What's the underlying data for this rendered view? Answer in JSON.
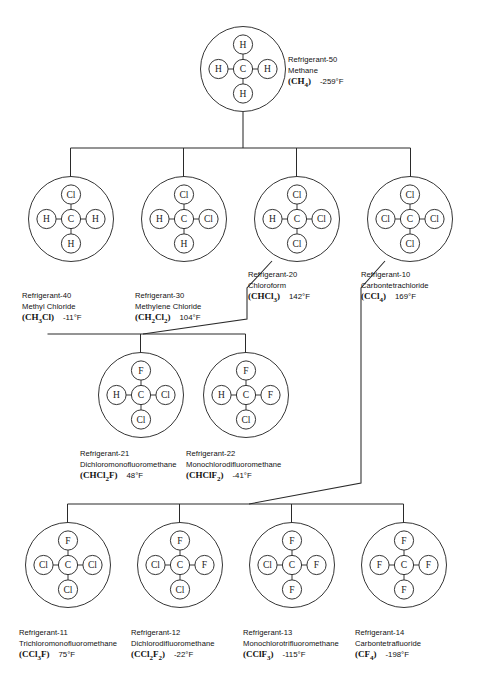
{
  "chart_data": {
    "type": "diagram",
    "xlabel": "",
    "ylabel": "",
    "layout": "hierarchical tree, 4 levels, parent node Methane at top",
    "nodes": [
      {
        "id": "r50",
        "refrigerant": "Refrigerant-50",
        "name": "Methane",
        "formula": "CH4",
        "formula_parts": [
          {
            "t": "(CH",
            "sub": false
          },
          {
            "t": "4",
            "sub": true
          },
          {
            "t": ")",
            "sub": false
          }
        ],
        "boiling_point": "-259°F",
        "bp_value": -259,
        "center_atom": "C",
        "top": "H",
        "left": "H",
        "right": "H",
        "bottom": "H",
        "x": 200,
        "y": 26,
        "level": 1
      },
      {
        "id": "r40",
        "refrigerant": "Refrigerant-40",
        "name": "Methyl Chloride",
        "formula": "CH3Cl",
        "formula_parts": [
          {
            "t": "(CH",
            "sub": false
          },
          {
            "t": "3",
            "sub": true
          },
          {
            "t": "Cl)",
            "sub": false
          }
        ],
        "boiling_point": "-11°F",
        "bp_value": -11,
        "center_atom": "C",
        "top": "Cl",
        "left": "H",
        "right": "H",
        "bottom": "H",
        "x": 28,
        "y": 176,
        "level": 2
      },
      {
        "id": "r30",
        "refrigerant": "Refrigerant-30",
        "name": "Methylene Chloride",
        "formula": "CH2Cl2",
        "formula_parts": [
          {
            "t": "(CH",
            "sub": false
          },
          {
            "t": "2",
            "sub": true
          },
          {
            "t": "Cl",
            "sub": false
          },
          {
            "t": "2",
            "sub": true
          },
          {
            "t": ")",
            "sub": false
          }
        ],
        "boiling_point": "104°F",
        "bp_value": 104,
        "center_atom": "C",
        "top": "Cl",
        "left": "H",
        "right": "Cl",
        "bottom": "H",
        "x": 141,
        "y": 176,
        "level": 2
      },
      {
        "id": "r20",
        "refrigerant": "Refrigerant-20",
        "name": "Chloroform",
        "formula": "CHCl3",
        "formula_parts": [
          {
            "t": "(CHCl",
            "sub": false
          },
          {
            "t": "3",
            "sub": true
          },
          {
            "t": ")",
            "sub": false
          }
        ],
        "boiling_point": "142°F",
        "bp_value": 142,
        "center_atom": "C",
        "top": "Cl",
        "left": "H",
        "right": "Cl",
        "bottom": "Cl",
        "x": 254,
        "y": 176,
        "level": 2
      },
      {
        "id": "r10",
        "refrigerant": "Refrigerant-10",
        "name": "Carbontetrachloride",
        "formula": "CCl4",
        "formula_parts": [
          {
            "t": "(CCl",
            "sub": false
          },
          {
            "t": "4",
            "sub": true
          },
          {
            "t": ")",
            "sub": false
          }
        ],
        "boiling_point": "169°F",
        "bp_value": 169,
        "center_atom": "C",
        "top": "Cl",
        "left": "Cl",
        "right": "Cl",
        "bottom": "Cl",
        "x": 367,
        "y": 176,
        "level": 2
      },
      {
        "id": "r21",
        "refrigerant": "Refrigerant-21",
        "name": "Dichloromonofluoromethane",
        "formula": "CHCl2F",
        "formula_parts": [
          {
            "t": "(CHCl",
            "sub": false
          },
          {
            "t": "2",
            "sub": true
          },
          {
            "t": "F)",
            "sub": false
          }
        ],
        "boiling_point": "48°F",
        "bp_value": 48,
        "center_atom": "C",
        "top": "F",
        "left": "H",
        "right": "Cl",
        "bottom": "Cl",
        "x": 98,
        "y": 352,
        "level": 3
      },
      {
        "id": "r22",
        "refrigerant": "Refrigerant-22",
        "name": "Monochlorodifluoromethane",
        "formula": "CHClF2",
        "formula_parts": [
          {
            "t": "(CHClF",
            "sub": false
          },
          {
            "t": "2",
            "sub": true
          },
          {
            "t": ")",
            "sub": false
          }
        ],
        "boiling_point": "-41°F",
        "bp_value": -41,
        "center_atom": "C",
        "top": "F",
        "left": "H",
        "right": "F",
        "bottom": "Cl",
        "x": 203,
        "y": 352,
        "level": 3
      },
      {
        "id": "r11",
        "refrigerant": "Refrigerant-11",
        "name": "Trichloromonofluoromethane",
        "formula": "CCl3F",
        "formula_parts": [
          {
            "t": "(CCl",
            "sub": false
          },
          {
            "t": "3",
            "sub": true
          },
          {
            "t": "F)",
            "sub": false
          }
        ],
        "boiling_point": "75°F",
        "bp_value": 75,
        "center_atom": "C",
        "top": "F",
        "left": "Cl",
        "right": "Cl",
        "bottom": "Cl",
        "x": 25,
        "y": 522,
        "level": 4
      },
      {
        "id": "r12",
        "refrigerant": "Refrigerant-12",
        "name": "Dichlorodifluoromethane",
        "formula": "CCl2F2",
        "formula_parts": [
          {
            "t": "(CCl",
            "sub": false
          },
          {
            "t": "2",
            "sub": true
          },
          {
            "t": "F",
            "sub": false
          },
          {
            "t": "2",
            "sub": true
          },
          {
            "t": ")",
            "sub": false
          }
        ],
        "boiling_point": "-22°F",
        "bp_value": -22,
        "center_atom": "C",
        "top": "F",
        "left": "Cl",
        "right": "F",
        "bottom": "Cl",
        "x": 137,
        "y": 522,
        "level": 4
      },
      {
        "id": "r13",
        "refrigerant": "Refrigerant-13",
        "name": "Monochlorotrifluoromethane",
        "formula": "CClF3",
        "formula_parts": [
          {
            "t": "(CClF",
            "sub": false
          },
          {
            "t": "3",
            "sub": true
          },
          {
            "t": ")",
            "sub": false
          }
        ],
        "boiling_point": "-115°F",
        "bp_value": -115,
        "center_atom": "C",
        "top": "F",
        "left": "Cl",
        "right": "F",
        "bottom": "F",
        "x": 249,
        "y": 522,
        "level": 4
      },
      {
        "id": "r14",
        "refrigerant": "Refrigerant-14",
        "name": "Carbontetrafluoride",
        "formula": "CF4",
        "formula_parts": [
          {
            "t": "(CF",
            "sub": false
          },
          {
            "t": "4",
            "sub": true
          },
          {
            "t": ")",
            "sub": false
          }
        ],
        "boiling_point": "-198°F",
        "bp_value": -198,
        "center_atom": "C",
        "top": "F",
        "left": "F",
        "right": "F",
        "bottom": "F",
        "x": 361,
        "y": 522,
        "level": 4
      }
    ],
    "edges": [
      {
        "from": "r50",
        "to": "r40"
      },
      {
        "from": "r50",
        "to": "r30"
      },
      {
        "from": "r50",
        "to": "r20"
      },
      {
        "from": "r50",
        "to": "r10"
      },
      {
        "from": "r20",
        "to": "r21"
      },
      {
        "from": "r20",
        "to": "r22"
      },
      {
        "from": "r10",
        "to": "r11"
      },
      {
        "from": "r10",
        "to": "r12"
      },
      {
        "from": "r10",
        "to": "r13"
      },
      {
        "from": "r10",
        "to": "r14"
      }
    ],
    "line_color": "#2a2a2a",
    "background": "#ffffff"
  },
  "captions": {
    "r50": {
      "x": 288,
      "y": 55
    },
    "r40": {
      "x": 22,
      "y": 291
    },
    "r30": {
      "x": 135,
      "y": 291
    },
    "r20": {
      "x": 248,
      "y": 270
    },
    "r10": {
      "x": 361,
      "y": 270
    },
    "r21": {
      "x": 80,
      "y": 449
    },
    "r22": {
      "x": 186,
      "y": 449
    },
    "r11": {
      "x": 19,
      "y": 628
    },
    "r12": {
      "x": 131,
      "y": 628
    },
    "r13": {
      "x": 243,
      "y": 628
    },
    "r14": {
      "x": 355,
      "y": 628
    }
  }
}
